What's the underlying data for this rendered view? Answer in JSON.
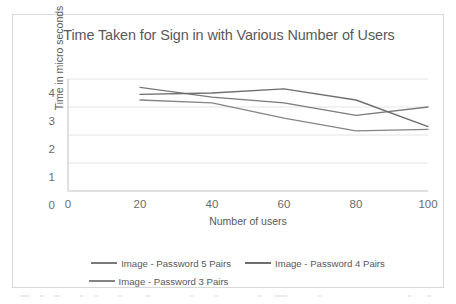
{
  "chart_data": {
    "type": "line",
    "title": "Time Taken for Sign in with Various Number of Users",
    "xlabel": "Number of users",
    "ylabel": "Time  in micro seconds",
    "xlim": [
      0,
      100
    ],
    "ylim": [
      0,
      4
    ],
    "xticks": [
      0,
      20,
      40,
      60,
      80,
      100
    ],
    "xtick_labels": [
      "0",
      "20",
      "40",
      "60",
      "80",
      "100"
    ],
    "yticks": [
      0,
      1,
      2,
      3,
      4
    ],
    "ytick_labels": [
      "0",
      "1",
      "2",
      "3",
      "4"
    ],
    "grid": "horizontal",
    "legend_position": "bottom",
    "x": [
      20,
      40,
      60,
      80,
      100
    ],
    "series": [
      {
        "name": "Image - Password 5 Pairs",
        "values": [
          3.7,
          3.35,
          3.15,
          2.7,
          3.0
        ],
        "color": "#7a7a7a"
      },
      {
        "name": "Image - Password 4 Pairs",
        "values": [
          3.45,
          3.5,
          3.65,
          3.25,
          2.3
        ],
        "color": "#6e6e6e"
      },
      {
        "name": "Image - Password 3 Pairs",
        "values": [
          3.25,
          3.15,
          2.6,
          2.15,
          2.2
        ],
        "color": "#858585"
      }
    ]
  },
  "chart": {
    "title": "Time Taken for Sign in with Various Number of Users",
    "xlabel": "Number of users",
    "ylabel": "Time  in micro seconds",
    "xtick_labels": [
      "0",
      "20",
      "40",
      "60",
      "80",
      "100"
    ],
    "ytick_labels": [
      "0",
      "1",
      "2",
      "3",
      "4"
    ]
  },
  "legend": {
    "row1": [
      {
        "label": "Image - Password 5 Pairs",
        "color": "#7a7a7a"
      },
      {
        "label": "Image - Password 4 Pairs",
        "color": "#6e6e6e"
      }
    ],
    "row2": [
      {
        "label": "Image - Password 3 Pairs",
        "color": "#858585"
      }
    ]
  },
  "colors": {
    "frame_border": "#d9d9d9",
    "gridline": "#e4e4e4",
    "axis_line": "#c9c9c9",
    "title_text": "#585858",
    "tick_text": "#6b6b6b",
    "label_text": "#595959",
    "background": "#ffffff"
  }
}
